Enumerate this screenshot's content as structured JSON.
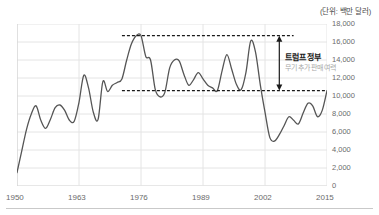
{
  "chart_data": {
    "type": "line",
    "title": "",
    "unit_label": "(단위: 백만 달러)",
    "xlabel": "",
    "ylabel": "",
    "xlim": [
      1950,
      2015
    ],
    "ylim": [
      0,
      18000
    ],
    "x_ticks": [
      "1950",
      "1963",
      "1976",
      "1989",
      "2002",
      "2015"
    ],
    "x_tick_values": [
      1950,
      1963,
      1976,
      1989,
      2002,
      2015
    ],
    "y_ticks": [
      "0",
      "2,000",
      "4,000",
      "6,000",
      "8,000",
      "10,000",
      "12,000",
      "14,000",
      "16,000",
      "18,000"
    ],
    "y_tick_values": [
      0,
      2000,
      4000,
      6000,
      8000,
      10000,
      12000,
      14000,
      16000,
      18000
    ],
    "grid": true,
    "legend": "none",
    "line_color": "#555555",
    "series": [
      {
        "name": "미국 무기 수출액",
        "x": [
          1950,
          1951,
          1952,
          1953,
          1954,
          1955,
          1956,
          1957,
          1958,
          1959,
          1960,
          1961,
          1962,
          1963,
          1964,
          1965,
          1966,
          1967,
          1968,
          1969,
          1970,
          1971,
          1972,
          1973,
          1974,
          1975,
          1976,
          1977,
          1978,
          1979,
          1980,
          1981,
          1982,
          1983,
          1984,
          1985,
          1986,
          1987,
          1988,
          1989,
          1990,
          1991,
          1992,
          1993,
          1994,
          1995,
          1996,
          1997,
          1998,
          1999,
          2000,
          2001,
          2002,
          2003,
          2004,
          2005,
          2006,
          2007,
          2008,
          2009,
          2010,
          2011,
          2012,
          2013,
          2014,
          2015
        ],
        "values": [
          1500,
          3900,
          6300,
          8000,
          8900,
          7300,
          6400,
          7400,
          8700,
          9000,
          8400,
          7300,
          7200,
          9300,
          12300,
          10900,
          8200,
          7400,
          11600,
          10500,
          11200,
          11500,
          11900,
          14000,
          15800,
          16700,
          16700,
          14400,
          14000,
          10700,
          9900,
          10400,
          13100,
          14000,
          13900,
          12400,
          11200,
          11800,
          12600,
          11900,
          11200,
          10900,
          10600,
          12800,
          14600,
          13000,
          11300,
          10700,
          12600,
          16100,
          14900,
          11300,
          8200,
          5400,
          5000,
          5700,
          6700,
          7700,
          7300,
          6900,
          8100,
          9200,
          8900,
          7700,
          8400,
          10600
        ],
        "color": "#555555"
      }
    ],
    "reference_lines": [
      {
        "name": "upper-reference",
        "value": 16700,
        "x_start": 1972,
        "x_end": 2008,
        "style": "dashed",
        "color": "#1a1a1a"
      },
      {
        "name": "lower-reference",
        "value": 10600,
        "x_start": 1972,
        "x_end": 2015,
        "style": "dashed",
        "color": "#1a1a1a"
      }
    ],
    "annotations": [
      {
        "name": "trump-gap-annotation",
        "title": "트럼프 정부",
        "subtitle": "무기 추가 판매 여력",
        "arrow_x": 2005,
        "arrow_top": 16700,
        "arrow_bottom": 10600,
        "gap": 6100
      }
    ]
  },
  "colors": {
    "grid": "#e4e4e4",
    "axis": "#cfcfcf",
    "line": "#555555",
    "dashed": "#1a1a1a",
    "tick_text": "#6b6b6b",
    "annotation_title": "#1a1a1a",
    "annotation_sub": "#a8a8a8"
  }
}
